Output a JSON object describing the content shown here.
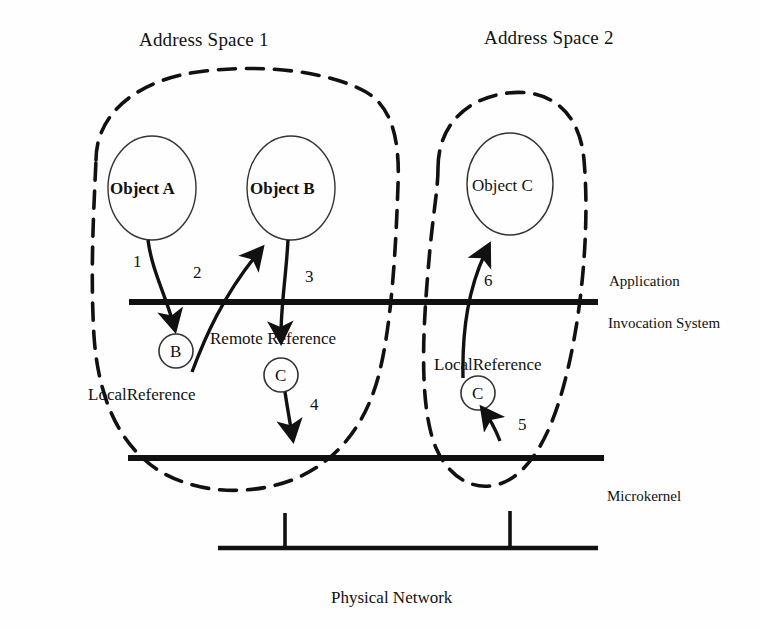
{
  "diagram": {
    "title_regions": [
      {
        "id": "address-space-1",
        "label": "Address Space 1"
      },
      {
        "id": "address-space-2",
        "label": "Address Space 2"
      }
    ],
    "objects": [
      {
        "id": "object-a",
        "label": "Object A",
        "bold": true
      },
      {
        "id": "object-b",
        "label": "Object B",
        "bold": true
      },
      {
        "id": "object-c",
        "label": "Object C",
        "bold": false
      }
    ],
    "reference_nodes": [
      {
        "id": "ref-b",
        "label": "B"
      },
      {
        "id": "ref-c-left",
        "label": "C"
      },
      {
        "id": "ref-c-right",
        "label": "C"
      }
    ],
    "reference_labels": [
      {
        "id": "local-reference-left",
        "label": "LocalReference"
      },
      {
        "id": "remote-reference",
        "label": "Remote Reference"
      },
      {
        "id": "local-reference-right",
        "label": "LocalReference"
      }
    ],
    "layer_labels": [
      {
        "id": "application",
        "label": "Application"
      },
      {
        "id": "invocation-system",
        "label": "Invocation System"
      },
      {
        "id": "microkernel",
        "label": "Microkernel"
      },
      {
        "id": "physical-network",
        "label": "Physical Network"
      }
    ],
    "step_numbers": [
      {
        "id": "step-1",
        "label": "1"
      },
      {
        "id": "step-2",
        "label": "2"
      },
      {
        "id": "step-3",
        "label": "3"
      },
      {
        "id": "step-4",
        "label": "4"
      },
      {
        "id": "step-5",
        "label": "5"
      },
      {
        "id": "step-6",
        "label": "6"
      }
    ],
    "colors": {
      "ink": "#111111",
      "background": "#fefefe",
      "thin_stroke": "#222222"
    }
  }
}
